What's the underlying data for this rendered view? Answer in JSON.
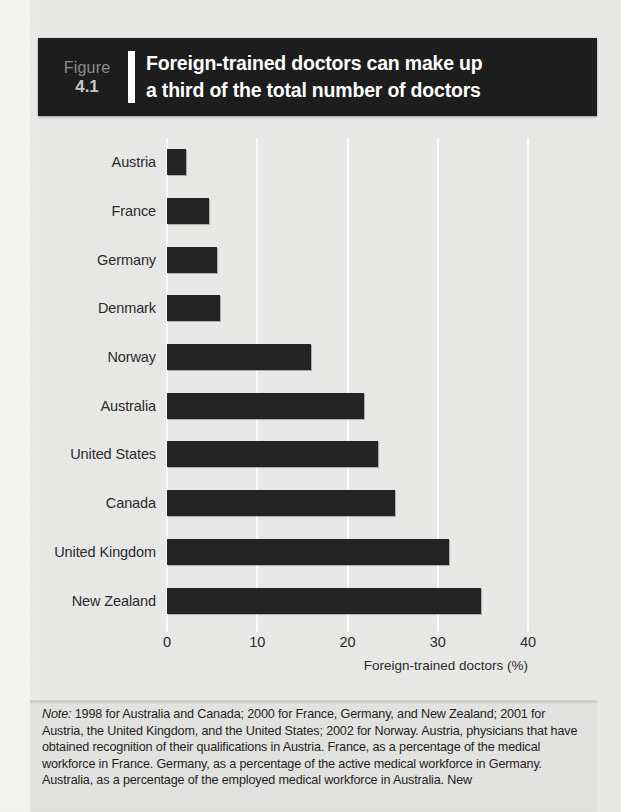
{
  "figure": {
    "label_word": "Figure",
    "number": "4.1",
    "title_line1": "Foreign-trained doctors can make up",
    "title_line2": "a third of the total number of doctors",
    "header_bg": "#1d1d1d",
    "label_color": "#8d8d8d",
    "title_color": "#ffffff"
  },
  "chart_data": {
    "type": "bar",
    "orientation": "horizontal",
    "title": "Foreign-trained doctors can make up a third of the total number of doctors",
    "subtitle": "",
    "xlabel": "Foreign-trained doctors (%)",
    "ylabel": "",
    "xlim": [
      0,
      40
    ],
    "xticks": [
      0,
      10,
      20,
      30,
      40
    ],
    "xtick_labels": [
      "0",
      "10",
      "20",
      "30",
      "40"
    ],
    "grid": "vertical-white",
    "legend": "none",
    "bar_color": "#242424",
    "categories": [
      "Austria",
      "France",
      "Germany",
      "Denmark",
      "Norway",
      "Australia",
      "United States",
      "Canada",
      "United Kingdom",
      "New Zealand"
    ],
    "values": [
      2.1,
      4.7,
      5.5,
      5.9,
      16.0,
      21.8,
      23.4,
      25.3,
      31.2,
      34.8
    ]
  },
  "note": {
    "prefix": "Note:",
    "body": " 1998 for Australia and Canada; 2000 for France, Germany, and New Zealand; 2001 for Austria, the United Kingdom, and the United States; 2002 for Norway. Austria, physicians that have obtained recognition of their qualifications in Austria. France, as a percentage of the medical workforce in France. Germany, as a percentage of the active medical workforce in Germany. Australia, as a percentage of the employed medical workforce in Australia. New"
  }
}
